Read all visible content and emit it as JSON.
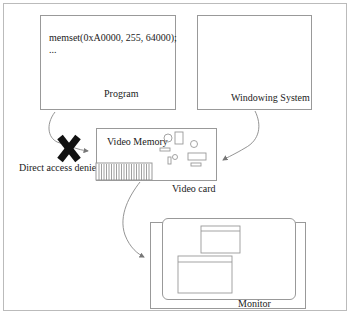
{
  "program": {
    "code_line1": "memset(0xA0000, 255, 64000);",
    "code_line2": "...",
    "label": "Program"
  },
  "windowing_system": {
    "label": "Windowing System"
  },
  "video_card": {
    "memory_label": "Video Memory",
    "label": "Video card"
  },
  "denied": {
    "label": "Direct access denied!"
  },
  "monitor": {
    "label": "Monitor"
  },
  "colors": {
    "line": "#999999",
    "cross": "#111111",
    "text": "#222222"
  }
}
